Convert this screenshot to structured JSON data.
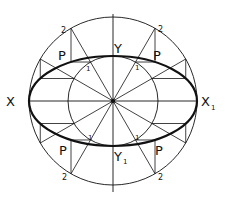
{
  "diagram": {
    "center": {
      "x": 113,
      "y": 101
    },
    "outer_circle_radius": 84,
    "inner_circle_radius": 45,
    "ellipse": {
      "rx": 84,
      "ry": 45
    },
    "colors": {
      "stroke": "#111111",
      "background": "#ffffff"
    },
    "labels": {
      "major_left": "X",
      "major_right": "X",
      "major_right_sub": "1",
      "minor_top": "Y",
      "minor_bottom": "Y",
      "minor_bottom_sub": "1",
      "point_p": "P",
      "inner_mark": "1",
      "outer_mark": "2"
    },
    "points": [
      {
        "quadrant": "top-left",
        "p_label": "P",
        "inner": "1",
        "outer": "2"
      },
      {
        "quadrant": "top-right",
        "p_label": "P",
        "inner": "1",
        "outer": "2"
      },
      {
        "quadrant": "bottom-left",
        "p_label": "P",
        "inner": "1",
        "outer": "2"
      },
      {
        "quadrant": "bottom-right",
        "p_label": "P",
        "inner": "1",
        "outer": "2"
      }
    ]
  }
}
